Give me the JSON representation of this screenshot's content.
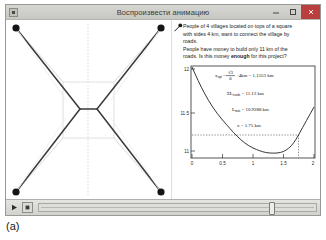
{
  "window": {
    "title": "Воспроизвести анимацию",
    "icon": "window-app-icon",
    "controls": {
      "minimize_label": "—",
      "maximize_label": "□",
      "close_label": "✕"
    }
  },
  "problem": {
    "line1": "People of 4 villages located on tops of a square",
    "line2": "with sides 4 km, want to connect the village by",
    "line3": "roads.",
    "line4": "People have money to build only 11 km of the",
    "line5_a": "roads. Is this money ",
    "line5_emph": "enough",
    "line5_b": " for this project?",
    "pin_icon": "pushpin-icon"
  },
  "diagram": {
    "name": "steiner-network-diagram",
    "square_side_km": 4,
    "node_count": 4,
    "node_labels": [
      "village-top-left",
      "village-top-right",
      "village-bottom-left",
      "village-bottom-right"
    ],
    "center_axis_label": "",
    "steiner_point_count": 2
  },
  "player": {
    "play_label": "▶",
    "stop_label": "■",
    "slider_value_percent": 83
  },
  "formulas": {
    "f1_lhs": "x",
    "f1_sub": "opt",
    "f1_eq": "=",
    "f1_frac_num": "√3",
    "f1_frac_den": "6",
    "f1_tail": "·4km = 1.1553 km",
    "f2_lhs": "ΣL",
    "f2_sub": "roads",
    "f2_rhs": "= 11.13 km",
    "f3_lhs": "L",
    "f3_sub": "min",
    "f3_rhs": "= 10.9288 km",
    "f4": "x = 1.75 km"
  },
  "caption": {
    "text": "(a)"
  },
  "chart_data": {
    "type": "line",
    "title": "",
    "xlabel": "",
    "ylabel": "",
    "xlim": [
      0,
      2
    ],
    "ylim": [
      10.9,
      12.05
    ],
    "xticks": [
      0,
      0.5,
      1,
      1.5,
      2
    ],
    "xtick_labels": [
      "0",
      "0.5",
      "1",
      "1.5",
      "2"
    ],
    "yticks": [
      11,
      11.5,
      12
    ],
    "ytick_labels": [
      "11",
      "11.5",
      "12"
    ],
    "grid": false,
    "series": [
      {
        "name": "total road length L(x)",
        "x": [
          0.0,
          0.1,
          0.2,
          0.3,
          0.4,
          0.5,
          0.6,
          0.7,
          0.8,
          0.9,
          1.0,
          1.1,
          1.1553,
          1.2,
          1.3,
          1.4,
          1.5,
          1.6,
          1.7,
          1.75,
          1.8,
          1.9,
          2.0
        ],
        "y": [
          12.0,
          11.803,
          11.621,
          11.456,
          11.312,
          11.193,
          11.1,
          11.033,
          10.991,
          10.967,
          10.95,
          10.9305,
          10.9288,
          10.9295,
          10.935,
          10.95,
          10.977,
          11.015,
          11.065,
          11.096,
          11.13,
          11.205,
          11.314
        ]
      }
    ],
    "markers": {
      "current_x": 1.75,
      "current_y": 11.13,
      "optimum_x": 1.1553,
      "optimum_y": 10.9288,
      "crosshair_style": "dotted"
    }
  }
}
